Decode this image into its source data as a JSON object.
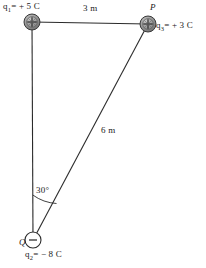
{
  "figure": {
    "stroke_color": "#2b2b2b",
    "charge_fill_color": "#8f8f8f",
    "background_color": "#ffffff"
  },
  "charges": [
    {
      "id": "q1",
      "name": "charge-q1",
      "label": "q₁ = + 5 C",
      "label_base": "q",
      "label_sub": "1",
      "label_rest": "= + 5 C",
      "sign_glyph": "+",
      "style": "shaded",
      "cx": 32,
      "cy": 22,
      "r": 8
    },
    {
      "id": "q3",
      "name": "charge-q3",
      "label": "q₃ = + 3 C",
      "label_base": "q",
      "label_sub": "3",
      "label_rest": "= + 3 C",
      "point_label": "P",
      "sign_glyph": "+",
      "style": "shaded",
      "cx": 148,
      "cy": 24,
      "r": 8
    },
    {
      "id": "q2",
      "name": "charge-q2",
      "label": "q₂ = − 8 C",
      "label_base": "q",
      "label_sub": "2",
      "label_rest": "= − 8 C",
      "point_label": "Q",
      "sign_glyph": "–",
      "style": "open",
      "cx": 33,
      "cy": 240,
      "r": 8
    }
  ],
  "dimensions": [
    {
      "name": "top-side-length",
      "text": "3 m",
      "from": "q1",
      "to": "q3"
    },
    {
      "name": "diagonal-length",
      "text": "6 m",
      "from": "q2",
      "to": "q3"
    }
  ],
  "angle": {
    "name": "angle-at-Q",
    "text": "30°",
    "value": 30,
    "unit": "degrees",
    "vertex": "Q"
  },
  "points": {
    "P": "P",
    "Q": "Q"
  }
}
